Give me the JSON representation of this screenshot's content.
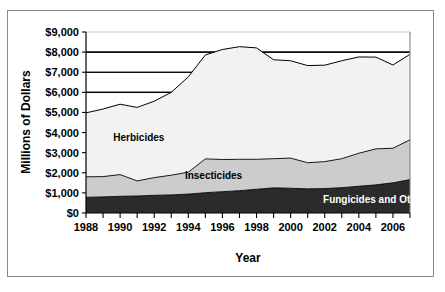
{
  "chart_data": {
    "type": "area",
    "stacked": true,
    "title": "",
    "xlabel": "Year",
    "ylabel": "Millions of Dollars",
    "x": [
      1988,
      1989,
      1990,
      1991,
      1992,
      1993,
      1994,
      1995,
      1996,
      1997,
      1998,
      1999,
      2000,
      2001,
      2002,
      2003,
      2004,
      2005,
      2006,
      2007
    ],
    "xtick_labels": [
      "1988",
      "1990",
      "1992",
      "1994",
      "1996",
      "1998",
      "2000",
      "2002",
      "2004",
      "2006"
    ],
    "xtick_values": [
      1988,
      1990,
      1992,
      1994,
      1996,
      1998,
      2000,
      2002,
      2004,
      2006
    ],
    "xlim": [
      1988,
      2007
    ],
    "ylim": [
      0,
      9000
    ],
    "ytick_labels": [
      "$0",
      "$1,000",
      "$2,000",
      "$3,000",
      "$4,000",
      "$5,000",
      "$6,000",
      "$7,000",
      "$8,000",
      "$9,000"
    ],
    "ytick_values": [
      0,
      1000,
      2000,
      3000,
      4000,
      5000,
      6000,
      7000,
      8000,
      9000
    ],
    "grid": "horizontal-partial",
    "gridline_values": [
      6000,
      7000,
      8000,
      9000
    ],
    "legend_position": "inline-annotations",
    "series": [
      {
        "name": "Fungicides and Others",
        "color": "#2b2b2b",
        "label_color": "#ffffff",
        "values": [
          780,
          800,
          830,
          845,
          880,
          900,
          940,
          1010,
          1060,
          1110,
          1180,
          1250,
          1230,
          1200,
          1215,
          1260,
          1330,
          1400,
          1500,
          1660
        ]
      },
      {
        "name": "Insecticides",
        "color": "#cccccc",
        "label_color": "#000000",
        "values": [
          1020,
          1010,
          1080,
          750,
          880,
          980,
          1090,
          1680,
          1600,
          1560,
          1490,
          1450,
          1500,
          1300,
          1340,
          1440,
          1640,
          1790,
          1720,
          1980
        ]
      },
      {
        "name": "Herbicides",
        "color": "#f2f2f2",
        "label_color": "#000000",
        "values": [
          3180,
          3360,
          3500,
          3655,
          3800,
          4120,
          4740,
          5170,
          5470,
          5600,
          5540,
          4920,
          4840,
          4830,
          4795,
          4870,
          4790,
          4560,
          4140,
          4250
        ]
      }
    ],
    "totals": [
      4980,
      5170,
      5410,
      5250,
      5560,
      6000,
      6770,
      7860,
      8130,
      8270,
      8210,
      7620,
      7570,
      7330,
      7350,
      7570,
      7760,
      7750,
      7360,
      7890
    ]
  },
  "annotations": {
    "herbicides": {
      "text": "Herbicides",
      "x": 1989.6,
      "y": 3600
    },
    "insecticides": {
      "text": "Insecticides",
      "x": 1993.8,
      "y": 1700
    },
    "fungicides": {
      "text": "Fungicides and Others",
      "x": 2001.9,
      "y": 500
    }
  }
}
